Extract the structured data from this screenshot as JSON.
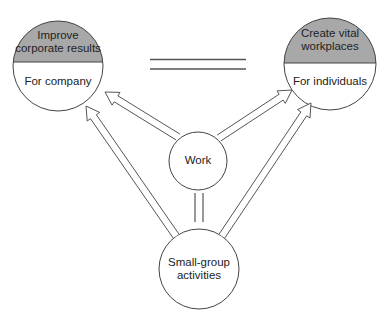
{
  "diagram": {
    "left_goal": {
      "title_line1": "Improve",
      "title_line2": "corporate results",
      "subtitle": "For company"
    },
    "right_goal": {
      "title_line1": "Create vital",
      "title_line2": "workplaces",
      "subtitle": "For individuals"
    },
    "center": {
      "label": "Work"
    },
    "bottom": {
      "label_line1": "Small-group",
      "label_line2": "activities"
    },
    "relations": [
      {
        "from": "Work",
        "to": "Improve corporate results",
        "type": "arrow"
      },
      {
        "from": "Work",
        "to": "Create vital workplaces",
        "type": "arrow"
      },
      {
        "from": "Small-group activities",
        "to": "Improve corporate results",
        "type": "arrow"
      },
      {
        "from": "Small-group activities",
        "to": "Create vital workplaces",
        "type": "arrow"
      },
      {
        "from": "Improve corporate results",
        "to": "Create vital workplaces",
        "type": "equal"
      },
      {
        "from": "Work",
        "to": "Small-group activities",
        "type": "equal"
      }
    ],
    "colors": {
      "header_fill": "#a8a8a8",
      "stroke": "#444444"
    }
  }
}
